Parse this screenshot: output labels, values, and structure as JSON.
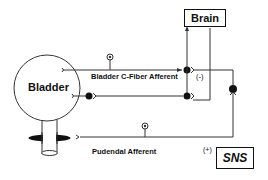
{
  "diagram": {
    "nodes": {
      "bladder": "Bladder",
      "brain": "Brain",
      "sns": "SNS"
    },
    "pathways": {
      "c_fiber": "Bladder C-Fiber Afferent",
      "pudendal": "Pudendal Afferent"
    },
    "signs": {
      "inhibitory": "(-)",
      "excitatory": "(+)"
    },
    "colors": {
      "line": "#333333",
      "text": "#111111",
      "background": "#ffffff"
    }
  }
}
